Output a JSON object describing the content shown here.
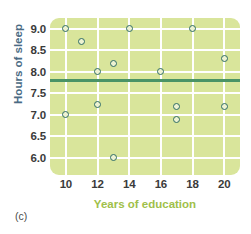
{
  "chart_data": {
    "type": "scatter",
    "title": "",
    "xlabel": "Years of education",
    "ylabel": "Hours of sleep",
    "xlim": [
      9,
      21
    ],
    "ylim": [
      5.6,
      9.25
    ],
    "xticks": [
      "10",
      "12",
      "14",
      "16",
      "18",
      "20"
    ],
    "xtick_values": [
      10,
      12,
      14,
      16,
      18,
      20
    ],
    "yticks": [
      "9.0",
      "8.5",
      "8.0",
      "7.5",
      "7.0",
      "6.5",
      "6.0"
    ],
    "ytick_values": [
      9.0,
      8.5,
      8.0,
      7.5,
      7.0,
      6.5,
      6.0
    ],
    "grid": true,
    "legend": "none",
    "points": [
      {
        "x": 10,
        "y": 9.0
      },
      {
        "x": 10,
        "y": 7.0
      },
      {
        "x": 11,
        "y": 8.7
      },
      {
        "x": 12,
        "y": 8.0
      },
      {
        "x": 12,
        "y": 7.25
      },
      {
        "x": 13,
        "y": 8.2
      },
      {
        "x": 13,
        "y": 6.0
      },
      {
        "x": 14,
        "y": 9.0
      },
      {
        "x": 16,
        "y": 8.0
      },
      {
        "x": 17,
        "y": 7.2
      },
      {
        "x": 17,
        "y": 6.9
      },
      {
        "x": 18,
        "y": 9.0
      },
      {
        "x": 20,
        "y": 8.3
      },
      {
        "x": 20,
        "y": 7.2
      }
    ],
    "reference_line": {
      "orientation": "horizontal",
      "value": 7.8,
      "color": "#4a9366"
    },
    "colors": {
      "plot_background": "#d9e59b",
      "gridline": "#ffffff",
      "marker_edge": "#2e6b64",
      "xlabel_color": "#9fc04a",
      "ylabel_color": "#4a6b84",
      "tick_color": "#3b3b3b"
    }
  },
  "caption": {
    "panel_label": "(c)"
  }
}
